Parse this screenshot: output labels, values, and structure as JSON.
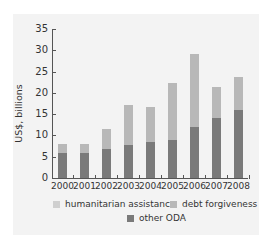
{
  "chart_data": {
    "type": "bar",
    "stacked": true,
    "title": "",
    "xlabel": "",
    "ylabel": "US$, billions",
    "ylim": [
      0,
      35
    ],
    "yticks": [
      0,
      5,
      10,
      15,
      20,
      25,
      30,
      35
    ],
    "categories": [
      "2000",
      "2001",
      "2002",
      "2003",
      "2004",
      "2005",
      "2006",
      "2007",
      "2008"
    ],
    "series": [
      {
        "name": "other ODA",
        "color": "#7a7a7a",
        "values": [
          6.0,
          5.9,
          6.8,
          7.7,
          8.5,
          8.9,
          12.0,
          14.1,
          16.0
        ]
      },
      {
        "name": "debt forgiveness",
        "color": "#b8b8b8",
        "values": [
          2.0,
          2.1,
          4.7,
          9.4,
          8.2,
          13.4,
          17.1,
          7.3,
          7.7
        ]
      },
      {
        "name": "humanitarian assistance",
        "color": "#cfcfcf",
        "values": [
          0,
          0,
          0,
          0,
          0,
          0,
          0,
          0,
          0
        ]
      }
    ],
    "totals": [
      8.0,
      8.0,
      11.5,
      17.1,
      16.7,
      22.3,
      29.1,
      21.4,
      23.7
    ],
    "grid": false,
    "legend_position": "bottom"
  },
  "legend": {
    "humanitarian": "humanitarian assistance",
    "debt": "debt forgiveness",
    "other": "other ODA"
  }
}
